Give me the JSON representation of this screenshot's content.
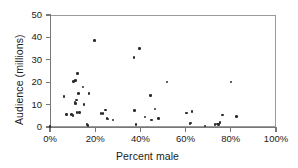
{
  "chart_data": {
    "type": "scatter",
    "title": "",
    "xlabel": "Percent male",
    "ylabel": "Audience (millions)",
    "xlim": [
      0,
      100
    ],
    "ylim": [
      0,
      50
    ],
    "grid": false,
    "legend": null,
    "xticks": [
      {
        "value": 0,
        "label": "0%"
      },
      {
        "value": 20,
        "label": "20%"
      },
      {
        "value": 40,
        "label": "40%"
      },
      {
        "value": 60,
        "label": "60%"
      },
      {
        "value": 80,
        "label": "80%"
      },
      {
        "value": 100,
        "label": "100%"
      }
    ],
    "yticks": [
      {
        "value": 0,
        "label": "0"
      },
      {
        "value": 10,
        "label": "10"
      },
      {
        "value": 20,
        "label": "20"
      },
      {
        "value": 30,
        "label": "30"
      },
      {
        "value": 40,
        "label": "40"
      },
      {
        "value": 50,
        "label": "50"
      }
    ],
    "marker": {
      "shape": "circle",
      "color": "#2b2b2b",
      "size": 2.6
    },
    "points": [
      {
        "x": 0.0,
        "y": 0.3
      },
      {
        "x": 6.2,
        "y": 13.6
      },
      {
        "x": 7.3,
        "y": 5.6
      },
      {
        "x": 9.6,
        "y": 5.6
      },
      {
        "x": 10.2,
        "y": 5.2
      },
      {
        "x": 10.4,
        "y": 20.4
      },
      {
        "x": 11.0,
        "y": 11.2
      },
      {
        "x": 11.3,
        "y": 20.8
      },
      {
        "x": 11.4,
        "y": 10.6
      },
      {
        "x": 11.8,
        "y": 12.0
      },
      {
        "x": 12.0,
        "y": 6.4
      },
      {
        "x": 12.3,
        "y": 23.9
      },
      {
        "x": 12.6,
        "y": 15.0
      },
      {
        "x": 13.0,
        "y": 6.4
      },
      {
        "x": 14.6,
        "y": 17.8
      },
      {
        "x": 15.0,
        "y": 10.0
      },
      {
        "x": 16.4,
        "y": 1.0
      },
      {
        "x": 16.8,
        "y": 0.8
      },
      {
        "x": 17.3,
        "y": 15.0
      },
      {
        "x": 19.8,
        "y": 38.6
      },
      {
        "x": 22.6,
        "y": 6.1
      },
      {
        "x": 23.5,
        "y": 6.0
      },
      {
        "x": 24.6,
        "y": 7.6
      },
      {
        "x": 25.2,
        "y": 3.7
      },
      {
        "x": 25.7,
        "y": 3.5
      },
      {
        "x": 27.8,
        "y": 3.2
      },
      {
        "x": 37.2,
        "y": 30.9
      },
      {
        "x": 37.4,
        "y": 7.4
      },
      {
        "x": 38.0,
        "y": 1.1
      },
      {
        "x": 39.6,
        "y": 35.0
      },
      {
        "x": 42.0,
        "y": 4.4
      },
      {
        "x": 44.5,
        "y": 14.1
      },
      {
        "x": 45.0,
        "y": 3.2
      },
      {
        "x": 46.5,
        "y": 8.1
      },
      {
        "x": 48.0,
        "y": 3.8
      },
      {
        "x": 51.8,
        "y": 20.0
      },
      {
        "x": 60.5,
        "y": 6.2
      },
      {
        "x": 62.0,
        "y": 1.5
      },
      {
        "x": 62.4,
        "y": 1.8
      },
      {
        "x": 62.8,
        "y": 6.8
      },
      {
        "x": 68.6,
        "y": 0.4
      },
      {
        "x": 73.0,
        "y": 1.2
      },
      {
        "x": 74.0,
        "y": 1.4
      },
      {
        "x": 74.6,
        "y": 1.0
      },
      {
        "x": 75.2,
        "y": 2.0
      },
      {
        "x": 76.2,
        "y": 5.4
      },
      {
        "x": 80.0,
        "y": 20.0
      },
      {
        "x": 82.6,
        "y": 4.6
      }
    ]
  }
}
